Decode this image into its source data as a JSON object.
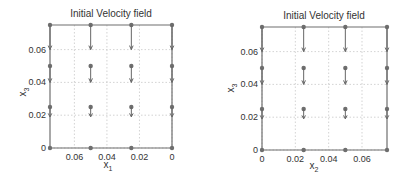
{
  "chart_data": [
    {
      "type": "quiver",
      "title": "Initial Velocity field",
      "xlabel": "x",
      "xlabel_sub": "1",
      "ylabel": "x",
      "ylabel_sub": "3",
      "x_reversed": true,
      "xlim": [
        0,
        0.075
      ],
      "ylim": [
        0,
        0.075
      ],
      "xticks": [
        "0.06",
        "0.04",
        "0.02",
        "0"
      ],
      "xtick_values": [
        0.06,
        0.04,
        0.02,
        0
      ],
      "yticks": [
        "0",
        "0.02",
        "0.04",
        "0.06"
      ],
      "ytick_values": [
        0,
        0.02,
        0.04,
        0.06
      ],
      "grid": true,
      "grid_points_x": [
        0,
        0.025,
        0.05,
        0.075
      ],
      "grid_points_y": [
        0,
        0.025,
        0.05,
        0.075
      ],
      "velocity": {
        "direction": "downward (negative x3)",
        "magnitude_by_height": [
          {
            "x3": 0,
            "length": 0
          },
          {
            "x3": 0.025,
            "length": 0.006
          },
          {
            "x3": 0.05,
            "length": 0.01
          },
          {
            "x3": 0.075,
            "length": 0.015
          }
        ]
      }
    },
    {
      "type": "quiver",
      "title": "Initial Velocity field",
      "xlabel": "x",
      "xlabel_sub": "2",
      "ylabel": "x",
      "ylabel_sub": "3",
      "x_reversed": false,
      "xlim": [
        0,
        0.075
      ],
      "ylim": [
        0,
        0.075
      ],
      "xticks": [
        "0",
        "0.02",
        "0.04",
        "0.06"
      ],
      "xtick_values": [
        0,
        0.02,
        0.04,
        0.06
      ],
      "yticks": [
        "0",
        "0.02",
        "0.04",
        "0.06"
      ],
      "ytick_values": [
        0,
        0.02,
        0.04,
        0.06
      ],
      "grid": true,
      "grid_points_x": [
        0,
        0.025,
        0.05,
        0.075
      ],
      "grid_points_y": [
        0,
        0.025,
        0.05,
        0.075
      ],
      "velocity": {
        "direction": "downward (negative x3)",
        "magnitude_by_height": [
          {
            "x3": 0,
            "length": 0
          },
          {
            "x3": 0.025,
            "length": 0.006
          },
          {
            "x3": 0.05,
            "length": 0.01
          },
          {
            "x3": 0.075,
            "length": 0.015
          }
        ]
      }
    }
  ],
  "colors": {
    "axis": "#6e6e6e",
    "grid": "#c8c8c8",
    "marker": "#6e6e6e",
    "arrow": "#666666",
    "text": "#333333"
  }
}
